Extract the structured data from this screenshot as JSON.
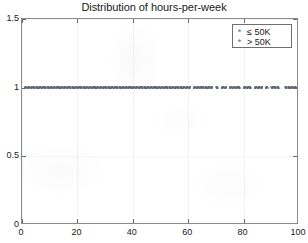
{
  "chart_data": {
    "type": "scatter",
    "title": "Distribution of hours-per-week",
    "xlabel": "",
    "ylabel": "",
    "xlim": [
      0,
      100
    ],
    "ylim": [
      0,
      1.5
    ],
    "xticks": [
      "0",
      "20",
      "40",
      "60",
      "80",
      "100"
    ],
    "xtick_values": [
      0,
      20,
      40,
      60,
      80,
      100
    ],
    "yticks": [
      "0",
      "0.5",
      "1",
      "1.5"
    ],
    "ytick_values": [
      0,
      0.5,
      1,
      1.5
    ],
    "grid": false,
    "legend_position": "top-right",
    "marker_color": "#5e6472",
    "marker_symbol": "*",
    "series": [
      {
        "name": "≤ 50K",
        "marker": "*",
        "color": "#5e6472",
        "y_level": 0,
        "x": [
          1,
          2,
          3,
          4,
          5,
          6,
          7,
          8,
          9,
          10,
          11,
          12,
          13,
          14,
          15,
          16,
          17,
          18,
          19,
          20,
          21,
          22,
          23,
          24,
          25,
          26,
          27,
          28,
          29,
          30,
          31,
          32,
          33,
          34,
          35,
          36,
          37,
          38,
          39,
          40,
          41,
          42,
          43,
          44,
          45,
          46,
          47,
          48,
          49,
          50,
          51,
          52,
          53,
          54,
          55,
          56,
          57,
          58,
          59,
          60,
          61,
          62,
          63,
          64,
          65,
          66,
          67,
          68,
          70,
          72,
          73,
          75,
          77,
          78,
          80,
          81,
          84,
          85,
          86,
          88,
          90,
          91,
          95,
          96,
          97,
          98,
          99
        ]
      },
      {
        "name": "> 50K",
        "marker": "*",
        "color": "#5e6472",
        "y_level": 1,
        "x": [
          1,
          2,
          3,
          4,
          5,
          6,
          7,
          8,
          9,
          10,
          11,
          12,
          13,
          14,
          15,
          16,
          17,
          18,
          19,
          20,
          21,
          22,
          23,
          24,
          25,
          26,
          27,
          28,
          29,
          30,
          31,
          32,
          33,
          34,
          35,
          36,
          37,
          38,
          39,
          40,
          41,
          42,
          43,
          44,
          45,
          46,
          47,
          48,
          49,
          50,
          51,
          52,
          53,
          54,
          55,
          56,
          57,
          58,
          59,
          60,
          62,
          63,
          64,
          65,
          66,
          67,
          68,
          70,
          72,
          73,
          75,
          76,
          77,
          78,
          80,
          81,
          82,
          84,
          85,
          86,
          88,
          90,
          91,
          92,
          95,
          96,
          97,
          98,
          99
        ]
      }
    ]
  },
  "legend": {
    "entries": [
      {
        "marker": "*",
        "label": "≤ 50K"
      },
      {
        "marker": "*",
        "label": "> 50K"
      }
    ]
  },
  "axes": {
    "x_tick_labels": [
      "0",
      "20",
      "40",
      "60",
      "80",
      "100"
    ],
    "y_tick_labels": [
      "0",
      "0.5",
      "1",
      "1.5"
    ]
  }
}
